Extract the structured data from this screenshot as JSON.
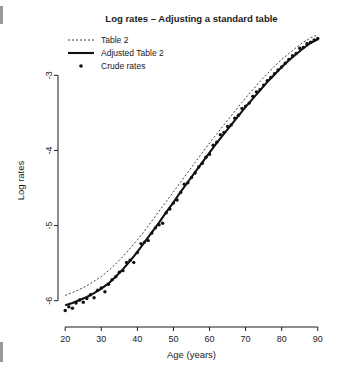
{
  "chart_data": {
    "type": "line",
    "title": "Log rates – Adjusting a standard table",
    "xlabel": "Age (years)",
    "ylabel": "Log rates",
    "xlim": [
      18,
      92
    ],
    "ylim": [
      -6.35,
      -2.45
    ],
    "xticks": [
      20,
      30,
      40,
      50,
      60,
      70,
      80,
      90
    ],
    "xtick_labels": [
      "20",
      "30",
      "40",
      "50",
      "60",
      "70",
      "80",
      "90"
    ],
    "yticks": [
      -6,
      -5,
      -4,
      -3
    ],
    "ytick_labels": [
      "-6",
      "-5",
      "-4",
      "-3"
    ],
    "grid": false,
    "legend_position": "top-left",
    "legend": [
      {
        "label": "Table 2",
        "style": "dotted-line",
        "color": "#2b2b2b"
      },
      {
        "label": "Adjusted Table 2",
        "style": "solid-thick-line",
        "color": "#111111"
      },
      {
        "label": "Crude rates",
        "style": "point",
        "color": "#111111"
      }
    ],
    "series": [
      {
        "name": "Table 2",
        "style": "dotted",
        "x": [
          20,
          22,
          24,
          26,
          28,
          30,
          32,
          34,
          36,
          38,
          40,
          42,
          44,
          46,
          48,
          50,
          52,
          54,
          56,
          58,
          60,
          62,
          64,
          66,
          68,
          70,
          72,
          74,
          76,
          78,
          80,
          82,
          84,
          86,
          88,
          90
        ],
        "values": [
          -5.93,
          -5.89,
          -5.85,
          -5.8,
          -5.74,
          -5.68,
          -5.6,
          -5.51,
          -5.41,
          -5.3,
          -5.19,
          -5.07,
          -4.94,
          -4.81,
          -4.68,
          -4.55,
          -4.42,
          -4.29,
          -4.16,
          -4.03,
          -3.9,
          -3.78,
          -3.66,
          -3.54,
          -3.42,
          -3.3,
          -3.19,
          -3.08,
          -2.98,
          -2.88,
          -2.79,
          -2.71,
          -2.63,
          -2.56,
          -2.5,
          -2.46
        ]
      },
      {
        "name": "Adjusted Table 2",
        "style": "solid",
        "x": [
          20,
          22,
          24,
          26,
          28,
          30,
          32,
          34,
          36,
          38,
          40,
          42,
          44,
          46,
          48,
          50,
          52,
          54,
          56,
          58,
          60,
          62,
          64,
          66,
          68,
          70,
          72,
          74,
          76,
          78,
          80,
          82,
          84,
          86,
          88,
          90
        ],
        "values": [
          -6.06,
          -6.03,
          -5.99,
          -5.95,
          -5.9,
          -5.84,
          -5.77,
          -5.68,
          -5.58,
          -5.47,
          -5.35,
          -5.22,
          -5.09,
          -4.96,
          -4.82,
          -4.69,
          -4.55,
          -4.42,
          -4.29,
          -4.16,
          -4.03,
          -3.9,
          -3.78,
          -3.66,
          -3.54,
          -3.42,
          -3.31,
          -3.2,
          -3.09,
          -2.99,
          -2.89,
          -2.8,
          -2.72,
          -2.64,
          -2.57,
          -2.52
        ]
      },
      {
        "name": "Crude rates",
        "style": "points",
        "x": [
          20,
          21,
          22,
          23,
          24,
          25,
          26,
          27,
          28,
          29,
          30,
          31,
          32,
          33,
          34,
          35,
          36,
          37,
          38,
          39,
          40,
          41,
          42,
          43,
          44,
          45,
          46,
          47,
          48,
          49,
          50,
          51,
          52,
          53,
          54,
          55,
          56,
          57,
          58,
          59,
          60,
          61,
          62,
          63,
          64,
          65,
          66,
          67,
          68,
          69,
          70,
          71,
          72,
          73,
          74,
          75,
          76,
          77,
          78,
          79,
          80,
          81,
          82,
          83,
          84,
          85,
          86,
          87,
          88,
          89,
          90
        ],
        "values": [
          -6.13,
          -6.08,
          -6.1,
          -6.03,
          -5.99,
          -6.02,
          -5.97,
          -5.92,
          -5.96,
          -5.86,
          -5.83,
          -5.88,
          -5.78,
          -5.72,
          -5.68,
          -5.62,
          -5.6,
          -5.49,
          -5.46,
          -5.49,
          -5.36,
          -5.24,
          -5.22,
          -5.2,
          -5.1,
          -5.03,
          -4.99,
          -4.97,
          -4.83,
          -4.78,
          -4.7,
          -4.66,
          -4.56,
          -4.45,
          -4.43,
          -4.36,
          -4.3,
          -4.22,
          -4.17,
          -4.09,
          -4.05,
          -3.93,
          -3.89,
          -3.79,
          -3.76,
          -3.68,
          -3.66,
          -3.57,
          -3.53,
          -3.44,
          -3.41,
          -3.37,
          -3.28,
          -3.22,
          -3.19,
          -3.13,
          -3.07,
          -3.03,
          -2.98,
          -2.93,
          -2.89,
          -2.84,
          -2.79,
          -2.74,
          -2.71,
          -2.64,
          -2.63,
          -2.58,
          -2.56,
          -2.53,
          -2.51
        ]
      }
    ]
  }
}
